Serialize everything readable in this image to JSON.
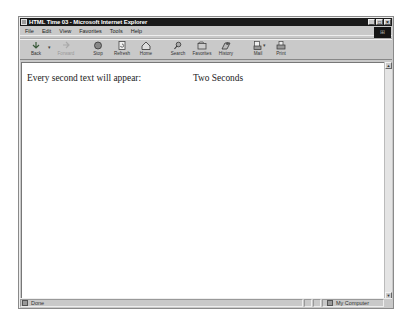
{
  "window": {
    "title": "HTML Time 03 - Microsoft Internet Explorer",
    "controls": {
      "minimize": "_",
      "maximize": "□",
      "close": "×"
    }
  },
  "menu": {
    "items": [
      {
        "label": "File"
      },
      {
        "label": "Edit"
      },
      {
        "label": "View"
      },
      {
        "label": "Favorites"
      },
      {
        "label": "Tools"
      },
      {
        "label": "Help"
      }
    ]
  },
  "toolbar": {
    "buttons": [
      {
        "label": "Back",
        "icon": "back-arrow-icon",
        "enabled": true
      },
      {
        "label": "Forward",
        "icon": "forward-arrow-icon",
        "enabled": false
      },
      {
        "label": "Stop",
        "icon": "stop-icon",
        "enabled": true
      },
      {
        "label": "Refresh",
        "icon": "refresh-icon",
        "enabled": true
      },
      {
        "label": "Home",
        "icon": "home-icon",
        "enabled": true
      },
      {
        "label": "Search",
        "icon": "search-icon",
        "enabled": true
      },
      {
        "label": "Favorites",
        "icon": "favorites-icon",
        "enabled": true
      },
      {
        "label": "History",
        "icon": "history-icon",
        "enabled": true
      },
      {
        "label": "Mail",
        "icon": "mail-icon",
        "enabled": true
      },
      {
        "label": "Print",
        "icon": "print-icon",
        "enabled": true
      }
    ],
    "dropdown_arrow": "▾"
  },
  "page": {
    "text": "Every second text will appear:",
    "value": "Two Seconds"
  },
  "scrollbar": {
    "up": "▲",
    "down": "▼"
  },
  "status": {
    "text": "Done",
    "zone": "My Computer"
  }
}
